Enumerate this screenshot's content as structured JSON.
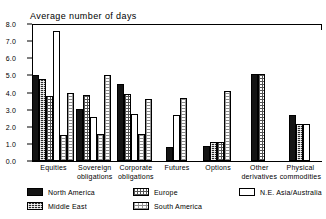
{
  "chart_data": {
    "type": "bar",
    "title": "Average number of days",
    "xlabel": "",
    "ylabel": "",
    "ylim": [
      0.0,
      8.0
    ],
    "ytick_labels": [
      "8.0",
      "7.0",
      "6.0",
      "5.0",
      "4.0",
      "3.0",
      "2.0",
      "1.0",
      "0.0"
    ],
    "ytick_values": [
      8.0,
      7.0,
      6.0,
      5.0,
      4.0,
      3.0,
      2.0,
      1.0,
      0.0
    ],
    "grid": false,
    "legend_position": "bottom",
    "categories": [
      "Equities",
      "Sovereign obligations",
      "Corporate obligations",
      "Futures",
      "Options",
      "Other derivatives",
      "Physical commodities"
    ],
    "category_lines": [
      [
        "Equities",
        ""
      ],
      [
        "Sovereign",
        "obligations"
      ],
      [
        "Corporate",
        "obligations"
      ],
      [
        "Futures",
        ""
      ],
      [
        "Options",
        ""
      ],
      [
        "Other",
        "derivatives"
      ],
      [
        "Physical",
        "commodities"
      ]
    ],
    "series": [
      {
        "name": "North America",
        "key": "na",
        "values": [
          5.0,
          3.05,
          4.5,
          0.8,
          0.9,
          5.1,
          2.7
        ]
      },
      {
        "name": "Middle East",
        "key": "me",
        "values": [
          4.8,
          null,
          null,
          null,
          1.1,
          null,
          2.15
        ]
      },
      {
        "name": "Europe",
        "key": "eu",
        "values": [
          3.8,
          3.85,
          3.9,
          null,
          1.1,
          5.1,
          2.15
        ]
      },
      {
        "name": "N.E. Asia/Australia",
        "key": "ne",
        "values": [
          7.6,
          2.55,
          2.75,
          2.7,
          null,
          null,
          null
        ]
      },
      {
        "name": "South America",
        "key": "sa",
        "values": [
          null,
          null,
          null,
          null,
          4.1,
          null,
          null
        ]
      }
    ],
    "group_bars": [
      [
        {
          "series": "North America",
          "key": "na",
          "value": 5.0
        },
        {
          "series": "Middle East",
          "key": "me",
          "value": 4.8
        },
        {
          "series": "Europe",
          "key": "eu",
          "value": 3.8
        },
        {
          "series": "N.E. Asia/Australia",
          "key": "ne",
          "value": 7.6
        },
        {
          "series": "South America",
          "key": "sa",
          "value": 1.5
        },
        {
          "series": "South America",
          "key": "sa2",
          "value": 4.0
        }
      ],
      [
        {
          "series": "North America",
          "key": "na",
          "value": 3.05
        },
        {
          "series": "Europe",
          "key": "eu",
          "value": 3.85
        },
        {
          "series": "N.E. Asia/Australia",
          "key": "ne",
          "value": 2.55
        },
        {
          "series": "South America",
          "key": "sa",
          "value": 1.55
        },
        {
          "series": "South America",
          "key": "sa2",
          "value": 5.05
        }
      ],
      [
        {
          "series": "North America",
          "key": "na",
          "value": 4.5
        },
        {
          "series": "Europe",
          "key": "eu",
          "value": 3.9
        },
        {
          "series": "N.E. Asia/Australia",
          "key": "ne",
          "value": 2.75
        },
        {
          "series": "South America",
          "key": "sa",
          "value": 1.55
        },
        {
          "series": "South America",
          "key": "sa2",
          "value": 3.65
        }
      ],
      [
        {
          "series": "North America",
          "key": "na",
          "value": 0.8
        },
        {
          "series": "N.E. Asia/Australia",
          "key": "ne",
          "value": 2.7
        },
        {
          "series": "South America",
          "key": "sa2",
          "value": 3.7
        }
      ],
      [
        {
          "series": "North America",
          "key": "na",
          "value": 0.9
        },
        {
          "series": "Middle East",
          "key": "me",
          "value": 1.1
        },
        {
          "series": "Europe",
          "key": "eu",
          "value": 1.1
        },
        {
          "series": "South America",
          "key": "sa2",
          "value": 4.1
        }
      ],
      [
        {
          "series": "North America",
          "key": "na",
          "value": 5.1
        },
        {
          "series": "Europe",
          "key": "eu",
          "value": 5.1
        }
      ],
      [
        {
          "series": "North America",
          "key": "na",
          "value": 2.7
        },
        {
          "series": "Middle East",
          "key": "me",
          "value": 2.15
        },
        {
          "series": "N.E. Asia/Australia",
          "key": "ne",
          "value": 2.15
        }
      ]
    ],
    "legend": [
      {
        "label": "North America",
        "key": "na"
      },
      {
        "label": "Middle East",
        "key": "me"
      },
      {
        "label": "Europe",
        "key": "eu"
      },
      {
        "label": "South America",
        "key": "sa"
      },
      {
        "label": "N.E. Asia/Australia",
        "key": "ne"
      }
    ]
  }
}
